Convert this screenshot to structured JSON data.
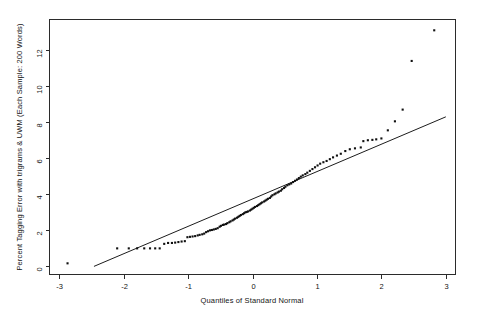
{
  "chart_data": {
    "type": "scatter",
    "title": "",
    "xlabel": "Quantiles of Standard Normal",
    "ylabel": "Percent Tagging Error with trigrams & UWM (Each Sample: 200 Words)",
    "xlim": [
      -3.15,
      3.15
    ],
    "ylim": [
      -0.45,
      13.7
    ],
    "xticks": [
      -3,
      -2,
      -1,
      0,
      1,
      2,
      3
    ],
    "xticklabels": [
      "-3",
      "-2",
      "-1",
      "0",
      "1",
      "2",
      "3"
    ],
    "yticks": [
      0,
      2,
      4,
      6,
      8,
      10,
      12
    ],
    "yticklabels": [
      "0",
      "2",
      "4",
      "6",
      "8",
      "10",
      "12"
    ],
    "grid": false,
    "legend": null,
    "marker": "filled-square",
    "marker_size": 2.1,
    "reference_line": {
      "label": "qqline",
      "x": [
        -2.46,
        3.0
      ],
      "y": [
        0.0,
        8.3
      ]
    },
    "points": [
      [
        -2.87,
        0.17
      ],
      [
        -2.1,
        1.0
      ],
      [
        -1.92,
        1.0
      ],
      [
        -1.79,
        1.0
      ],
      [
        -1.68,
        1.0
      ],
      [
        -1.59,
        1.0
      ],
      [
        -1.51,
        1.0
      ],
      [
        -1.44,
        1.0
      ],
      [
        -1.37,
        1.25
      ],
      [
        -1.31,
        1.3
      ],
      [
        -1.25,
        1.3
      ],
      [
        -1.2,
        1.32
      ],
      [
        -1.15,
        1.35
      ],
      [
        -1.1,
        1.38
      ],
      [
        -1.05,
        1.4
      ],
      [
        -1.01,
        1.62
      ],
      [
        -0.97,
        1.64
      ],
      [
        -0.93,
        1.66
      ],
      [
        -0.89,
        1.68
      ],
      [
        -0.85,
        1.72
      ],
      [
        -0.82,
        1.75
      ],
      [
        -0.78,
        1.78
      ],
      [
        -0.75,
        1.82
      ],
      [
        -0.72,
        1.9
      ],
      [
        -0.69,
        1.95
      ],
      [
        -0.66,
        2.0
      ],
      [
        -0.63,
        2.02
      ],
      [
        -0.6,
        2.05
      ],
      [
        -0.57,
        2.08
      ],
      [
        -0.54,
        2.12
      ],
      [
        -0.51,
        2.2
      ],
      [
        -0.49,
        2.25
      ],
      [
        -0.46,
        2.3
      ],
      [
        -0.44,
        2.32
      ],
      [
        -0.41,
        2.35
      ],
      [
        -0.39,
        2.4
      ],
      [
        -0.36,
        2.45
      ],
      [
        -0.34,
        2.5
      ],
      [
        -0.31,
        2.55
      ],
      [
        -0.29,
        2.6
      ],
      [
        -0.27,
        2.65
      ],
      [
        -0.24,
        2.7
      ],
      [
        -0.22,
        2.75
      ],
      [
        -0.2,
        2.8
      ],
      [
        -0.18,
        2.85
      ],
      [
        -0.15,
        2.9
      ],
      [
        -0.13,
        2.95
      ],
      [
        -0.11,
        3.0
      ],
      [
        -0.09,
        3.02
      ],
      [
        -0.07,
        3.05
      ],
      [
        -0.04,
        3.1
      ],
      [
        -0.02,
        3.15
      ],
      [
        0.0,
        3.2
      ],
      [
        0.02,
        3.25
      ],
      [
        0.04,
        3.3
      ],
      [
        0.07,
        3.35
      ],
      [
        0.09,
        3.4
      ],
      [
        0.11,
        3.45
      ],
      [
        0.13,
        3.5
      ],
      [
        0.15,
        3.55
      ],
      [
        0.18,
        3.6
      ],
      [
        0.2,
        3.65
      ],
      [
        0.22,
        3.7
      ],
      [
        0.24,
        3.75
      ],
      [
        0.27,
        3.8
      ],
      [
        0.29,
        3.88
      ],
      [
        0.31,
        3.95
      ],
      [
        0.34,
        4.0
      ],
      [
        0.36,
        4.05
      ],
      [
        0.39,
        4.1
      ],
      [
        0.41,
        4.15
      ],
      [
        0.44,
        4.2
      ],
      [
        0.46,
        4.28
      ],
      [
        0.49,
        4.35
      ],
      [
        0.51,
        4.42
      ],
      [
        0.54,
        4.5
      ],
      [
        0.57,
        4.55
      ],
      [
        0.6,
        4.6
      ],
      [
        0.63,
        4.68
      ],
      [
        0.66,
        4.75
      ],
      [
        0.69,
        4.82
      ],
      [
        0.72,
        4.9
      ],
      [
        0.75,
        4.98
      ],
      [
        0.78,
        5.05
      ],
      [
        0.82,
        5.12
      ],
      [
        0.85,
        5.2
      ],
      [
        0.89,
        5.3
      ],
      [
        0.93,
        5.4
      ],
      [
        0.97,
        5.5
      ],
      [
        1.01,
        5.6
      ],
      [
        1.05,
        5.7
      ],
      [
        1.1,
        5.78
      ],
      [
        1.15,
        5.85
      ],
      [
        1.2,
        5.95
      ],
      [
        1.25,
        6.05
      ],
      [
        1.31,
        6.15
      ],
      [
        1.37,
        6.25
      ],
      [
        1.44,
        6.4
      ],
      [
        1.51,
        6.5
      ],
      [
        1.59,
        6.55
      ],
      [
        1.68,
        6.6
      ],
      [
        1.72,
        6.95
      ],
      [
        1.79,
        7.0
      ],
      [
        1.86,
        7.02
      ],
      [
        1.92,
        7.05
      ],
      [
        2.0,
        7.1
      ],
      [
        2.1,
        7.55
      ],
      [
        2.21,
        8.05
      ],
      [
        2.33,
        8.7
      ],
      [
        2.47,
        11.4
      ],
      [
        2.82,
        13.1
      ]
    ]
  },
  "figure": {
    "background_color": "#ffffff",
    "axis_color": "#2b2b2b",
    "point_color": "#101010",
    "line_color": "#1c1c1c"
  }
}
